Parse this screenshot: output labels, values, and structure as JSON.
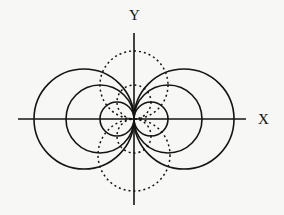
{
  "diagram": {
    "background": "#f7f7f5",
    "stroke_color": "#141414",
    "origin": {
      "x": 134,
      "y": 119
    },
    "axes": {
      "x": {
        "label": "X",
        "x1": 18,
        "x2": 246,
        "y": 119,
        "label_x": 258,
        "label_y": 124
      },
      "y": {
        "label": "Y",
        "y1": 33,
        "y2": 205,
        "x": 134,
        "label_x": 129,
        "label_y": 20
      }
    },
    "solid_circles": [
      {
        "name": "left-large",
        "cx": 84,
        "cy": 119,
        "r": 50
      },
      {
        "name": "left-medium",
        "cx": 100,
        "cy": 119,
        "r": 34
      },
      {
        "name": "left-small",
        "cx": 117,
        "cy": 119,
        "r": 17
      },
      {
        "name": "right-large",
        "cx": 184,
        "cy": 119,
        "r": 50
      },
      {
        "name": "right-medium",
        "cx": 168,
        "cy": 119,
        "r": 34
      },
      {
        "name": "right-small",
        "cx": 151,
        "cy": 119,
        "r": 17
      }
    ],
    "dashed_circles": [
      {
        "name": "upper-large",
        "cx": 134,
        "cy": 85,
        "r": 34
      },
      {
        "name": "upper-small",
        "cx": 134,
        "cy": 102,
        "r": 17
      },
      {
        "name": "lower-large",
        "cx": 134,
        "cy": 155,
        "r": 36
      },
      {
        "name": "lower-small",
        "cx": 134,
        "cy": 136,
        "r": 17
      }
    ]
  }
}
